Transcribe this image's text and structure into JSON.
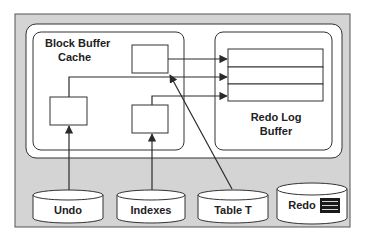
{
  "diagram": {
    "block_buffer_cache": {
      "label_line1": "Block Buffer",
      "label_line2": "Cache"
    },
    "redo_log_buffer": {
      "label_line1": "Redo Log",
      "label_line2": "Buffer",
      "entry_count": 3
    },
    "datafiles": [
      {
        "id": "undo",
        "label": "Undo"
      },
      {
        "id": "indexes",
        "label": "Indexes"
      },
      {
        "id": "table-t",
        "label": "Table T"
      },
      {
        "id": "redo",
        "label": "Redo",
        "icon": "log-lines-icon"
      }
    ],
    "connections": [
      {
        "from": "undo",
        "to": "cache-block-left"
      },
      {
        "from": "indexes",
        "to": "cache-block-center"
      },
      {
        "from": "table-t",
        "to": "cache-block-top"
      },
      {
        "from": "cache-block-top",
        "to": "redo-entry-1"
      },
      {
        "from": "cache-block-left",
        "to": "redo-entry-2"
      },
      {
        "from": "cache-block-center",
        "to": "redo-entry-3"
      }
    ]
  },
  "colors": {
    "panel_bg": "#d4d4d4",
    "frame_bg": "#ffffff",
    "stroke": "#2a2a2a",
    "redo_icon": "#1a1a1a"
  }
}
